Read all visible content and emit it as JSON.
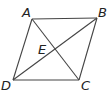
{
  "diagram": {
    "type": "parallelogram with diagonals",
    "points": {
      "A": {
        "label": "A",
        "x": 32,
        "y": 19,
        "lx": 22,
        "ly": 17
      },
      "B": {
        "label": "B",
        "x": 97,
        "y": 18,
        "lx": 98,
        "ly": 17
      },
      "C": {
        "label": "C",
        "x": 79,
        "y": 80,
        "lx": 81,
        "ly": 90
      },
      "D": {
        "label": "D",
        "x": 13,
        "y": 80,
        "lx": 1,
        "ly": 90
      },
      "E": {
        "label": "E",
        "x": 54,
        "y": 49,
        "lx": 38,
        "ly": 54
      }
    },
    "segments": [
      [
        "A",
        "B"
      ],
      [
        "B",
        "C"
      ],
      [
        "C",
        "D"
      ],
      [
        "D",
        "A"
      ],
      [
        "A",
        "C"
      ],
      [
        "B",
        "D"
      ]
    ],
    "stroke_color": "#444444"
  }
}
